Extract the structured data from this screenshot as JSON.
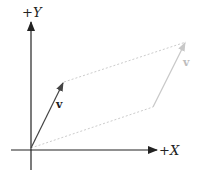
{
  "diagram": {
    "title": "",
    "axes": {
      "x": {
        "sign": "+",
        "name": "X"
      },
      "y": {
        "sign": "+",
        "name": "Y"
      },
      "color": "#222222"
    },
    "vectors": [
      {
        "id": "v-original",
        "label": "v",
        "color": "#444444",
        "style": "solid",
        "from": [
          0,
          0
        ],
        "to": [
          1,
          2
        ]
      },
      {
        "id": "v-translated",
        "label": "v",
        "color": "#c8c8c8",
        "style": "solid",
        "from": [
          4.5,
          1
        ],
        "to": [
          5.5,
          3
        ]
      }
    ],
    "guides": [
      {
        "id": "guide-top",
        "color": "#c8c8c8",
        "style": "dashed",
        "from": [
          1,
          2
        ],
        "to": [
          5.5,
          3
        ]
      },
      {
        "id": "guide-bottom",
        "color": "#c8c8c8",
        "style": "dashed",
        "from": [
          0,
          0
        ],
        "to": [
          4.5,
          1
        ]
      }
    ]
  }
}
